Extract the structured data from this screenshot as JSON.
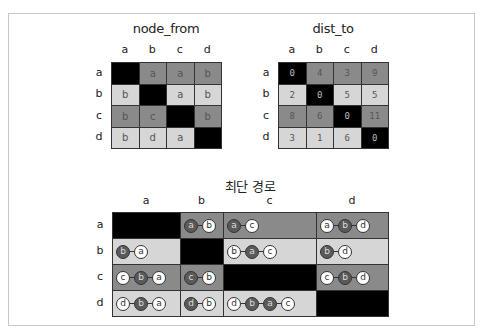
{
  "colors": {
    "black": "#000000",
    "mid": "#8a8a8a",
    "light": "#d6d6d6"
  },
  "labels": [
    "a",
    "b",
    "c",
    "d"
  ],
  "node_from": {
    "title": "node_from",
    "cells": [
      [
        {
          "text": "",
          "shade": "black"
        },
        {
          "text": "a",
          "shade": "mid"
        },
        {
          "text": "a",
          "shade": "mid"
        },
        {
          "text": "b",
          "shade": "mid"
        }
      ],
      [
        {
          "text": "b",
          "shade": "light"
        },
        {
          "text": "",
          "shade": "black"
        },
        {
          "text": "a",
          "shade": "light"
        },
        {
          "text": "b",
          "shade": "light"
        }
      ],
      [
        {
          "text": "b",
          "shade": "mid"
        },
        {
          "text": "c",
          "shade": "mid"
        },
        {
          "text": "",
          "shade": "black"
        },
        {
          "text": "b",
          "shade": "mid"
        }
      ],
      [
        {
          "text": "b",
          "shade": "light"
        },
        {
          "text": "d",
          "shade": "light"
        },
        {
          "text": "a",
          "shade": "light"
        },
        {
          "text": "",
          "shade": "black"
        }
      ]
    ]
  },
  "dist_to": {
    "title": "dist_to",
    "cells": [
      [
        {
          "text": "0",
          "shade": "black"
        },
        {
          "text": "4",
          "shade": "mid"
        },
        {
          "text": "3",
          "shade": "mid"
        },
        {
          "text": "9",
          "shade": "mid"
        }
      ],
      [
        {
          "text": "2",
          "shade": "light"
        },
        {
          "text": "0",
          "shade": "black"
        },
        {
          "text": "5",
          "shade": "light"
        },
        {
          "text": "5",
          "shade": "light"
        }
      ],
      [
        {
          "text": "8",
          "shade": "mid"
        },
        {
          "text": "6",
          "shade": "mid"
        },
        {
          "text": "0",
          "shade": "black"
        },
        {
          "text": "11",
          "shade": "mid"
        }
      ],
      [
        {
          "text": "3",
          "shade": "light"
        },
        {
          "text": "1",
          "shade": "light"
        },
        {
          "text": "6",
          "shade": "light"
        },
        {
          "text": "0",
          "shade": "black"
        }
      ]
    ]
  },
  "shortest_path": {
    "title": "최단 경로",
    "cells": [
      [
        {
          "path": [],
          "shade": "black"
        },
        {
          "path": [
            "a",
            "b"
          ],
          "shade": "mid"
        },
        {
          "path": [
            "a",
            "c"
          ],
          "shade": "mid"
        },
        {
          "path": [
            "a",
            "b",
            "d"
          ],
          "shade": "mid"
        }
      ],
      [
        {
          "path": [
            "b",
            "a"
          ],
          "shade": "light"
        },
        {
          "path": [],
          "shade": "black"
        },
        {
          "path": [
            "b",
            "a",
            "c"
          ],
          "shade": "light"
        },
        {
          "path": [
            "b",
            "d"
          ],
          "shade": "light"
        }
      ],
      [
        {
          "path": [
            "c",
            "b",
            "a"
          ],
          "shade": "mid"
        },
        {
          "path": [
            "c",
            "b"
          ],
          "shade": "mid"
        },
        {
          "path": [],
          "shade": "black"
        },
        {
          "path": [
            "c",
            "b",
            "d"
          ],
          "shade": "mid"
        }
      ],
      [
        {
          "path": [
            "d",
            "b",
            "a"
          ],
          "shade": "light"
        },
        {
          "path": [
            "d",
            "b"
          ],
          "shade": "light"
        },
        {
          "path": [
            "d",
            "b",
            "a",
            "c"
          ],
          "shade": "light"
        },
        {
          "path": [],
          "shade": "black"
        }
      ]
    ],
    "path_styles": {
      "a": {
        "0": "via",
        "1": "end"
      },
      "note": "start node dark when path has exactly 2 nodes and start is row source; see rendering"
    }
  }
}
